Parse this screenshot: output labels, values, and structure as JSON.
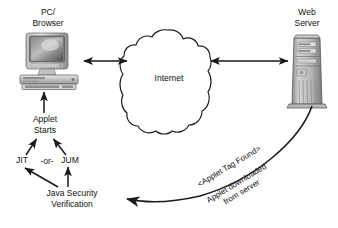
{
  "diagram": {
    "nodes": {
      "client": {
        "label": "PC/\nBrowser",
        "icon": "desktop-computer-icon"
      },
      "network": {
        "label": "Internet",
        "icon": "cloud-icon"
      },
      "server": {
        "label": "Web\nServer",
        "icon": "server-tower-icon"
      },
      "applet_starts": {
        "label": "Applet\nStarts"
      },
      "jit": {
        "label": "JIT"
      },
      "or": {
        "label": "-or-"
      },
      "jum": {
        "label": "JUM"
      },
      "security": {
        "label": "Java Security\nVerification"
      }
    },
    "edges": {
      "client_to_net": {
        "label": "",
        "style": "double-arrow"
      },
      "net_to_server": {
        "label": "",
        "style": "double-arrow"
      },
      "starts_to_client": {
        "label": "",
        "style": "arrow-up"
      },
      "jit_to_starts": {
        "label": "",
        "style": "arrow-up-right"
      },
      "jum_to_starts": {
        "label": "",
        "style": "arrow-up-left"
      },
      "security_to_jit": {
        "label": "",
        "style": "arrow-up-left"
      },
      "security_to_jum": {
        "label": "",
        "style": "arrow-up"
      },
      "server_to_security": {
        "label_top": "<Applet Tag Found>",
        "label_bottom": "Applet downloaded\nfrom server",
        "style": "curved-arrow-left"
      }
    },
    "colors": {
      "line": "#1a1a1a",
      "text": "#111111",
      "background": "#ffffff",
      "device_light": "#d8d8d8",
      "device_mid": "#a8a8a8",
      "device_dark": "#6e6e6e",
      "screen": "#5a5a5a"
    }
  }
}
